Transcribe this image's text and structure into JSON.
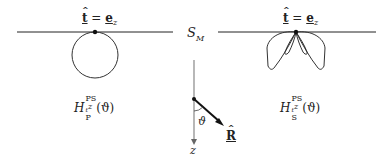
{
  "figure": {
    "surface_label": "S_M",
    "surface_label_main": "S",
    "surface_label_sub": "M",
    "left_panel": {
      "top_label_lhs": "t",
      "top_label_eq": " = ",
      "top_label_rhs": "e",
      "top_label_rhs_sub": "z",
      "pattern_shape": "circle",
      "caption_main": "H",
      "caption_sup": "PS",
      "caption_sup_sub": "t",
      "caption_sup_tail": "z",
      "caption_sub": "P",
      "caption_arg": "(ϑ)"
    },
    "right_panel": {
      "top_label_lhs": "t",
      "top_label_eq": " = ",
      "top_label_rhs": "e",
      "top_label_rhs_sub": "z",
      "pattern_shape": "four-lobe",
      "caption_main": "H",
      "caption_sup": "PS",
      "caption_sup_sub": "t",
      "caption_sup_tail": "z",
      "caption_sub": "S",
      "caption_arg": "(ϑ)"
    },
    "axis": {
      "axis_label": "z",
      "angle_label": "ϑ",
      "vector_label": "R"
    },
    "colors": {
      "line": "#222222",
      "background": "#ffffff"
    }
  }
}
